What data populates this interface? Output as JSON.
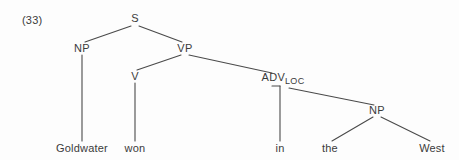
{
  "figure": {
    "example_number": "(33)",
    "sentence": "Goldwater won in the West",
    "ink_color": "#3b3b3b",
    "background_color": "#fdfdfd"
  },
  "tree": {
    "nodes": [
      {
        "id": "s",
        "label": "S",
        "subscript": "",
        "x": 135,
        "y": 20
      },
      {
        "id": "np1",
        "label": "NP",
        "subscript": "",
        "x": 82,
        "y": 50
      },
      {
        "id": "vp",
        "label": "VP",
        "subscript": "",
        "x": 185,
        "y": 50
      },
      {
        "id": "v",
        "label": "V",
        "subscript": "",
        "x": 135,
        "y": 78
      },
      {
        "id": "advloc",
        "label": "ADV",
        "subscript": "LOC",
        "x": 283,
        "y": 79
      },
      {
        "id": "np2",
        "label": "NP",
        "subscript": "",
        "x": 377,
        "y": 112
      }
    ],
    "terminals": [
      {
        "id": "t-goldwater",
        "label": "Goldwater",
        "x": 82,
        "y": 150
      },
      {
        "id": "t-won",
        "label": "won",
        "x": 135,
        "y": 150
      },
      {
        "id": "t-in",
        "label": "in",
        "x": 280,
        "y": 150
      },
      {
        "id": "t-the",
        "label": "the",
        "x": 330,
        "y": 150
      },
      {
        "id": "t-west",
        "label": "West",
        "x": 432,
        "y": 150
      }
    ],
    "edges": [
      {
        "id": "e-s-np1",
        "from": "S",
        "to": "NP",
        "x1": 131,
        "y1": 26,
        "x2": 85,
        "y2": 42
      },
      {
        "id": "e-s-vp",
        "from": "S",
        "to": "VP",
        "x1": 139,
        "y1": 26,
        "x2": 182,
        "y2": 42
      },
      {
        "id": "e-np1-gw",
        "from": "NP",
        "to": "Goldwater",
        "x1": 82,
        "y1": 55,
        "x2": 82,
        "y2": 141
      },
      {
        "id": "e-vp-v",
        "from": "VP",
        "to": "V",
        "x1": 181,
        "y1": 55,
        "x2": 137,
        "y2": 70
      },
      {
        "id": "e-vp-adv",
        "from": "VP",
        "to": "ADV_LOC",
        "x1": 189,
        "y1": 55,
        "x2": 272,
        "y2": 73
      },
      {
        "id": "e-v-won",
        "from": "V",
        "to": "won",
        "x1": 135,
        "y1": 83,
        "x2": 135,
        "y2": 141
      },
      {
        "id": "e-adv-in",
        "from": "ADV_LOC",
        "to": "in",
        "x1": 280,
        "y1": 86,
        "x2": 280,
        "y2": 141
      },
      {
        "id": "e-adv-np2",
        "from": "ADV_LOC",
        "to": "NP",
        "x1": 289,
        "y1": 88,
        "x2": 374,
        "y2": 105
      },
      {
        "id": "e-np2-the",
        "from": "NP",
        "to": "the",
        "x1": 373,
        "y1": 117,
        "x2": 332,
        "y2": 141
      },
      {
        "id": "e-np2-west",
        "from": "NP",
        "to": "West",
        "x1": 381,
        "y1": 117,
        "x2": 430,
        "y2": 141
      }
    ],
    "joint": {
      "id": "adv-joint",
      "x1": 272,
      "y1": 86,
      "x2": 280,
      "y2": 86
    }
  }
}
